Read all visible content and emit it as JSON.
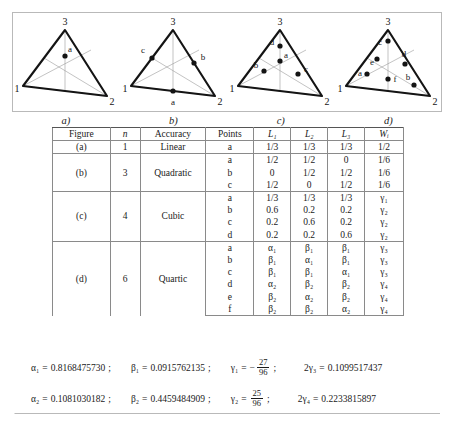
{
  "figures": [
    {
      "id": "a",
      "caption": "a)",
      "vertex_labels": [
        "1",
        "2",
        "3"
      ],
      "points": [
        {
          "label": "a",
          "lx": 52,
          "ly": 44,
          "tx": 56,
          "ty": 37
        }
      ]
    },
    {
      "id": "b",
      "caption": "b)",
      "vertex_labels": [
        "1",
        "2",
        "3"
      ],
      "points": [
        {
          "label": "a",
          "lx": 52,
          "ly": 74,
          "tx": 52,
          "ty": 88
        },
        {
          "label": "b",
          "lx": 72,
          "ly": 44,
          "tx": 80,
          "ty": 40
        },
        {
          "label": "c",
          "lx": 32,
          "ly": 33,
          "tx": 23,
          "ty": 29
        }
      ]
    },
    {
      "id": "c",
      "caption": "c)",
      "vertex_labels": [
        "1",
        "2",
        "3"
      ],
      "points": [
        {
          "label": "a",
          "lx": 52,
          "ly": 46,
          "tx": 56,
          "ty": 40
        },
        {
          "label": "b",
          "lx": 36,
          "ly": 56,
          "tx": 28,
          "ty": 49
        },
        {
          "label": "c",
          "lx": 68,
          "ly": 59,
          "tx": 74,
          "ty": 55
        },
        {
          "label": "d",
          "lx": 52,
          "ly": 31,
          "tx": 44,
          "ty": 28
        }
      ]
    },
    {
      "id": "d",
      "caption": "d)",
      "vertex_labels": [
        "1",
        "2",
        "3"
      ],
      "points": [
        {
          "label": "a",
          "lx": 32,
          "ly": 58,
          "tx": 26,
          "ty": 60
        },
        {
          "label": "b",
          "lx": 75,
          "ly": 66,
          "tx": 70,
          "ty": 61
        },
        {
          "label": "c",
          "lx": 52,
          "ly": 24,
          "tx": 45,
          "ty": 30
        },
        {
          "label": "d",
          "lx": 66,
          "ly": 44,
          "tx": 66,
          "ty": 38
        },
        {
          "label": "e",
          "lx": 41,
          "ly": 44,
          "tx": 37,
          "ty": 51
        },
        {
          "label": "f",
          "lx": 52,
          "ly": 63,
          "tx": 57,
          "ty": 64
        }
      ]
    }
  ],
  "table": {
    "headers": [
      "Figure",
      "n",
      "Accuracy",
      "Points",
      "L₁",
      "L₂",
      "L₃",
      "Wᵢ"
    ],
    "groups": [
      {
        "figure": "(a)",
        "n": "1",
        "accuracy": "Linear",
        "rows": [
          {
            "point": "a",
            "L1": "1/3",
            "L2": "1/3",
            "L3": "1/3",
            "W": "1/2"
          }
        ]
      },
      {
        "figure": "(b)",
        "n": "3",
        "accuracy": "Quadratic",
        "rows": [
          {
            "point": "a",
            "L1": "1/2",
            "L2": "1/2",
            "L3": "0",
            "W": "1/6"
          },
          {
            "point": "b",
            "L1": "0",
            "L2": "1/2",
            "L3": "1/2",
            "W": "1/6"
          },
          {
            "point": "c",
            "L1": "1/2",
            "L2": "0",
            "L3": "1/2",
            "W": "1/6"
          }
        ]
      },
      {
        "figure": "(c)",
        "n": "4",
        "accuracy": "Cubic",
        "rows": [
          {
            "point": "a",
            "L1": "1/3",
            "L2": "1/3",
            "L3": "1/3",
            "W": "γ₁"
          },
          {
            "point": "b",
            "L1": "0.6",
            "L2": "0.2",
            "L3": "0.2",
            "W": "γ₂"
          },
          {
            "point": "c",
            "L1": "0.2",
            "L2": "0.6",
            "L3": "0.2",
            "W": "γ₂"
          },
          {
            "point": "d",
            "L1": "0.2",
            "L2": "0.2",
            "L3": "0.6",
            "W": "γ₂"
          }
        ]
      },
      {
        "figure": "(d)",
        "n": "6",
        "accuracy": "Quartic",
        "rows": [
          {
            "point": "a",
            "L1": "α₁",
            "L2": "β₁",
            "L3": "β₁",
            "W": "γ₃"
          },
          {
            "point": "b",
            "L1": "β₁",
            "L2": "α₁",
            "L3": "β₁",
            "W": "γ₃"
          },
          {
            "point": "c",
            "L1": "β₁",
            "L2": "β₁",
            "L3": "α₁",
            "W": "γ₃"
          },
          {
            "point": "d",
            "L1": "α₂",
            "L2": "β₂",
            "L3": "β₂",
            "W": "γ₄"
          },
          {
            "point": "e",
            "L1": "β₂",
            "L2": "α₂",
            "L3": "β₂",
            "W": "γ₄"
          },
          {
            "point": "f",
            "L1": "β₂",
            "L2": "β₂",
            "L3": "α₂",
            "W": "γ₄"
          }
        ]
      }
    ]
  },
  "constants": {
    "row1": {
      "alpha_sym": "α₁",
      "alpha_val": "0.8168475730",
      "beta_sym": "β₁",
      "beta_val": "0.0915762135",
      "gamma_sym": "γ₁",
      "gamma_sign": "−",
      "gamma_num": "27",
      "gamma_den": "96",
      "twogamma_sym": "2γ₃",
      "twogamma_val": "0.1099517437",
      "semi": ";"
    },
    "row2": {
      "alpha_sym": "α₂",
      "alpha_val": "0.1081030182",
      "beta_sym": "β₂",
      "beta_val": "0.4459484909",
      "gamma_sym": "γ₂",
      "gamma_sign": "",
      "gamma_num": "25",
      "gamma_den": "96",
      "twogamma_sym": "2γ₄",
      "twogamma_val": "0.2233815897",
      "semi": ";"
    },
    "equals": "="
  },
  "colors": {
    "frame": "#b9b9b9",
    "rule": "#8a8a8a",
    "ink": "#1a1a1a",
    "thin_line": "#9a9a9a"
  }
}
